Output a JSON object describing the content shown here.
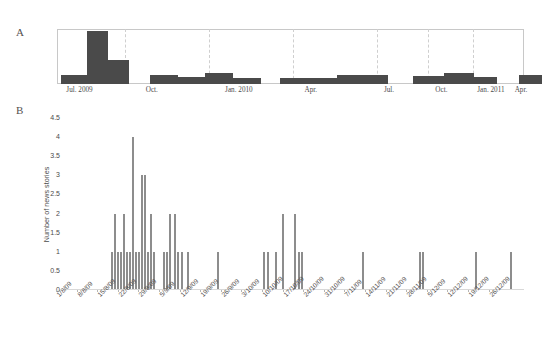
{
  "figure": {
    "panel_a_letter": "A",
    "panel_b_letter": "B"
  },
  "chart_data": [
    {
      "id": "panel-a",
      "type": "bar",
      "title": "",
      "subtitle": "",
      "xlabel": "",
      "ylabel": "",
      "grid": true,
      "grid_style": "dashed-vertical",
      "legend": "none",
      "bar_color": "#4a4a4a",
      "frame_color": "#c8c8c8",
      "xlim": [
        "Jun. 2009",
        "May 2011"
      ],
      "ylim": [
        0,
        1
      ],
      "axis_tick_labels": [
        "Jul. 2009",
        "Oct.",
        "Jan. 2010",
        "Apr.",
        "Jul.",
        "Oct.",
        "Jan. 2011",
        "Apr."
      ],
      "tick_positions_pct": [
        2.0,
        19.0,
        36.0,
        53.0,
        70.0,
        81.0,
        90.0,
        98.0
      ],
      "gridline_positions_pct": [
        14.5,
        32.5,
        50.5,
        68.5,
        79.5,
        89.0
      ],
      "categories": [
        "Jun. 2009",
        "Jul. 2009",
        "Aug. 2009",
        "Sep. 2009",
        "Oct. 2009",
        "Nov. 2009",
        "Dec. 2009",
        "Jan. 2010",
        "Feb. 2010",
        "Mar. 2010",
        "Apr. 2010",
        "May 2010",
        "Jun. 2010",
        "Jul. 2010",
        "Aug. 2010",
        "Sep. 2010",
        "Oct. 2010",
        "Nov. 2010",
        "Dec. 2010",
        "Jan. 2011",
        "Feb. 2011",
        "Mar. 2011",
        "Apr. 2011"
      ],
      "values": [
        0.16,
        1.0,
        0.45,
        0.0,
        0.16,
        0.13,
        0.2,
        0.12,
        0.0,
        0.1,
        0.1,
        0.16,
        0.16,
        0.0,
        0.0,
        0.14,
        0.2,
        0.13,
        0.0,
        0.0,
        0.0,
        0.16,
        0.0
      ],
      "bars_px": [
        {
          "left": 4,
          "width": 26,
          "height": 9,
          "label": "Jun. 2009"
        },
        {
          "left": 30,
          "width": 21,
          "height": 53,
          "label": "Jul. 2009"
        },
        {
          "left": 51,
          "width": 21,
          "height": 24,
          "label": "Aug. 2009"
        },
        {
          "left": 72,
          "width": 21,
          "height": 0,
          "label": "Sep. 2009"
        },
        {
          "left": 93,
          "width": 28,
          "height": 9,
          "label": "Oct. 2009"
        },
        {
          "left": 121,
          "width": 27,
          "height": 7,
          "label": "Nov. 2009"
        },
        {
          "left": 148,
          "width": 28,
          "height": 11,
          "label": "Dec. 2009"
        },
        {
          "left": 176,
          "width": 28,
          "height": 6,
          "label": "Jan. 2010"
        },
        {
          "left": 204,
          "width": 19,
          "height": 0,
          "label": "Feb. 2010"
        },
        {
          "left": 223,
          "width": 30,
          "height": 6,
          "label": "Mar. 2010"
        },
        {
          "left": 253,
          "width": 27,
          "height": 6,
          "label": "Apr. 2010"
        },
        {
          "left": 280,
          "width": 27,
          "height": 9,
          "label": "May 2010"
        },
        {
          "left": 307,
          "width": 24,
          "height": 9,
          "label": "Jun. 2010"
        },
        {
          "left": 356,
          "width": 31,
          "height": 8,
          "label": "Oct. 2010"
        },
        {
          "left": 387,
          "width": 30,
          "height": 11,
          "label": "Nov. 2010"
        },
        {
          "left": 417,
          "width": 23,
          "height": 7,
          "label": "Dec. 2010"
        },
        {
          "left": 462,
          "width": 23,
          "height": 9,
          "label": "Apr. 2011"
        }
      ]
    },
    {
      "id": "panel-b",
      "type": "bar",
      "title": "",
      "subtitle": "",
      "xlabel": "",
      "ylabel": "Number of news stories",
      "grid": false,
      "legend": "none",
      "bar_color": "#8d8d8d",
      "ylim": [
        0,
        4.5
      ],
      "ytick_labels": [
        "4.5",
        "4",
        "3.5",
        "3",
        "2.5",
        "2",
        "1.5",
        "1",
        "0.5",
        "0"
      ],
      "ytick_values": [
        4.5,
        4,
        3.5,
        3,
        2.5,
        2,
        1.5,
        1,
        0.5,
        0
      ],
      "xtick_labels": [
        "1/8/09",
        "8/8/09",
        "15/8/09",
        "22/8/09",
        "29/8/09",
        "5/9/09",
        "12/9/09",
        "19/9/09",
        "26/9/09",
        "3/10/09",
        "10/10/09",
        "17/10/09",
        "24/10/09",
        "31/10/09",
        "7/11/09",
        "14/11/09",
        "21/11/09",
        "28/11/09",
        "5/12/09",
        "12/12/09",
        "19/12/09",
        "26/12/09"
      ],
      "bars_px": [
        {
          "x": 47,
          "value": 1
        },
        {
          "x": 50,
          "value": 2
        },
        {
          "x": 53,
          "value": 1
        },
        {
          "x": 56,
          "value": 1
        },
        {
          "x": 59,
          "value": 2
        },
        {
          "x": 62,
          "value": 1
        },
        {
          "x": 65,
          "value": 1
        },
        {
          "x": 68,
          "value": 4
        },
        {
          "x": 71,
          "value": 1
        },
        {
          "x": 74,
          "value": 1
        },
        {
          "x": 77,
          "value": 3
        },
        {
          "x": 80,
          "value": 3
        },
        {
          "x": 83,
          "value": 1
        },
        {
          "x": 86,
          "value": 2
        },
        {
          "x": 89,
          "value": 1
        },
        {
          "x": 99,
          "value": 1
        },
        {
          "x": 102,
          "value": 1
        },
        {
          "x": 105,
          "value": 2
        },
        {
          "x": 110,
          "value": 2
        },
        {
          "x": 113,
          "value": 1
        },
        {
          "x": 117,
          "value": 1
        },
        {
          "x": 123,
          "value": 1
        },
        {
          "x": 153,
          "value": 1
        },
        {
          "x": 199,
          "value": 1
        },
        {
          "x": 203,
          "value": 1
        },
        {
          "x": 211,
          "value": 1
        },
        {
          "x": 218,
          "value": 2
        },
        {
          "x": 230,
          "value": 2
        },
        {
          "x": 234,
          "value": 1
        },
        {
          "x": 237,
          "value": 1
        },
        {
          "x": 298,
          "value": 1
        },
        {
          "x": 355,
          "value": 1
        },
        {
          "x": 358,
          "value": 1
        },
        {
          "x": 411,
          "value": 1
        },
        {
          "x": 446,
          "value": 1
        }
      ]
    }
  ]
}
